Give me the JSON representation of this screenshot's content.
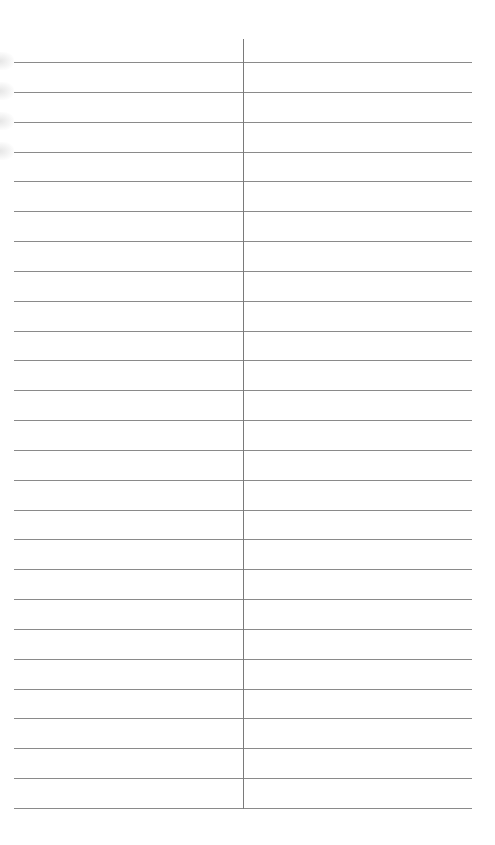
{
  "document": {
    "type": "lined-two-column-sheet",
    "rule_count": 26,
    "first_rule_y": 62,
    "last_rule_y": 808,
    "rule_left": 14,
    "rule_right": 472,
    "divider_x": 243,
    "divider_top": 39,
    "rule_color": "#8a8a8a",
    "divider_color": "#7a7a7a",
    "background": "#ffffff",
    "left_column_entries": [],
    "right_column_entries": []
  }
}
